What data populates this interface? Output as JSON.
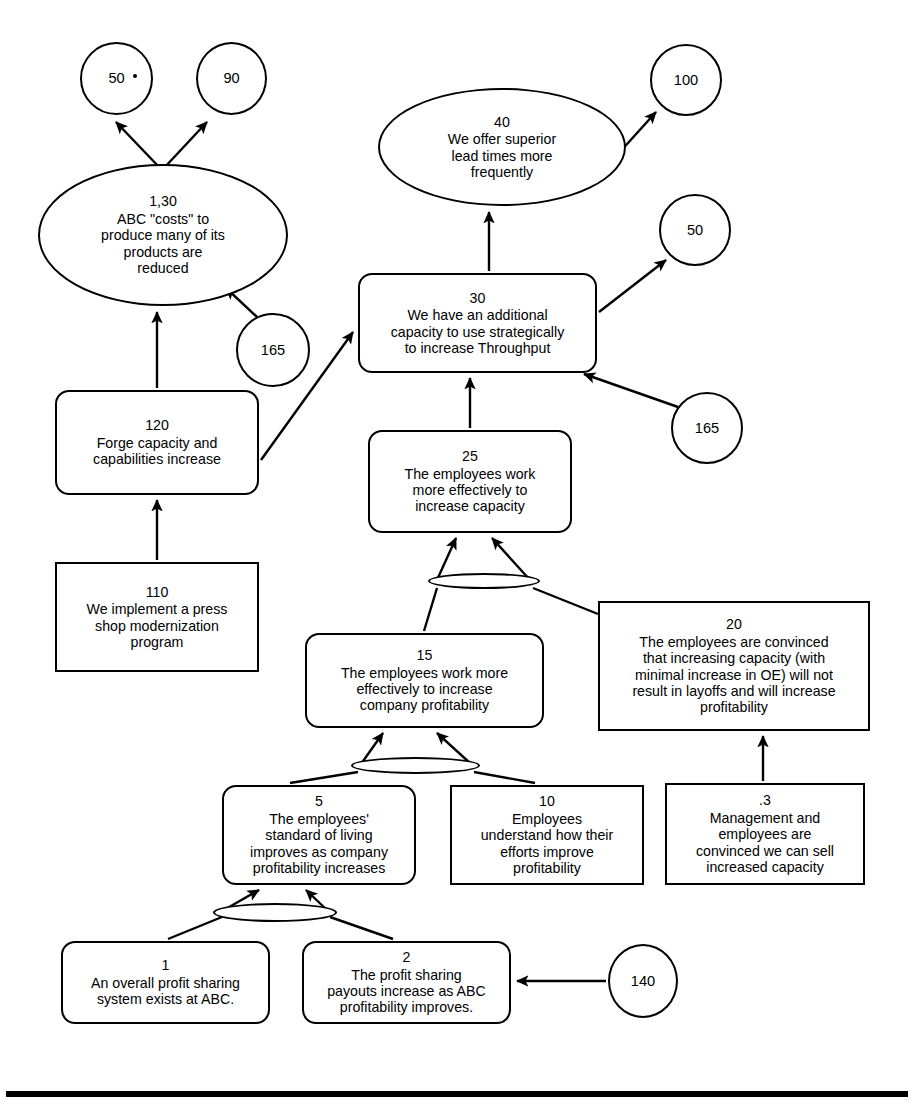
{
  "diagram": {
    "line_color": "#000000",
    "fill_color": "#ffffff",
    "nodes": [
      {
        "key": "n50a",
        "id": "50",
        "text": "",
        "shape": "circle",
        "x": 80,
        "y": 42,
        "w": 73,
        "h": 73
      },
      {
        "key": "n90",
        "id": "90",
        "text": "",
        "shape": "circle",
        "x": 196,
        "y": 42,
        "w": 71,
        "h": 73
      },
      {
        "key": "n130",
        "id": "1,30",
        "text": "ABC \"costs\" to\nproduce many of its\nproducts are\nreduced",
        "shape": "ellipse",
        "x": 38,
        "y": 164,
        "w": 250,
        "h": 142
      },
      {
        "key": "n120",
        "id": "120",
        "text": "Forge capacity and\ncapabilities increase",
        "shape": "roundbox",
        "x": 55,
        "y": 390,
        "w": 204,
        "h": 105
      },
      {
        "key": "n110",
        "id": "110",
        "text": "We implement a press\nshop modernization\nprogram",
        "shape": "box",
        "x": 55,
        "y": 562,
        "w": 204,
        "h": 110
      },
      {
        "key": "n165a",
        "id": "165",
        "text": "",
        "shape": "circle",
        "x": 236,
        "y": 313,
        "w": 74,
        "h": 74
      },
      {
        "key": "n40",
        "id": "40",
        "text": "We offer superior\nlead times more\nfrequently",
        "shape": "ellipse",
        "x": 378,
        "y": 88,
        "w": 248,
        "h": 118
      },
      {
        "key": "n100",
        "id": "100",
        "text": "",
        "shape": "circle",
        "x": 650,
        "y": 44,
        "w": 72,
        "h": 72
      },
      {
        "key": "n30",
        "id": "30",
        "text": "We have an additional\ncapacity to use strategically\nto increase Throughput",
        "shape": "roundbox",
        "x": 358,
        "y": 273,
        "w": 239,
        "h": 100
      },
      {
        "key": "n50b",
        "id": "50",
        "text": "",
        "shape": "circle",
        "x": 659,
        "y": 194,
        "w": 72,
        "h": 72
      },
      {
        "key": "n165b",
        "id": "165",
        "text": "",
        "shape": "circle",
        "x": 671,
        "y": 392,
        "w": 72,
        "h": 72
      },
      {
        "key": "n25",
        "id": "25",
        "text": "The employees work\nmore effectively to\nincrease capacity",
        "shape": "roundbox",
        "x": 368,
        "y": 430,
        "w": 204,
        "h": 103
      },
      {
        "key": "n20",
        "id": "20",
        "text": "The employees are convinced\nthat increasing capacity (with\nminimal increase in OE) will not\nresult in layoffs and will increase\nprofitability",
        "shape": "box",
        "x": 598,
        "y": 601,
        "w": 272,
        "h": 130
      },
      {
        "key": "n15",
        "id": "15",
        "text": "The employees work more\neffectively to increase\ncompany profitability",
        "shape": "roundbox",
        "x": 305,
        "y": 633,
        "w": 239,
        "h": 95
      },
      {
        "key": "n5",
        "id": "5",
        "text": "The employees'\nstandard of living\nimproves as company\nprofitability increases",
        "shape": "roundbox",
        "x": 222,
        "y": 785,
        "w": 194,
        "h": 100
      },
      {
        "key": "n10",
        "id": "10",
        "text": "Employees\nunderstand how their\nefforts improve\nprofitability",
        "shape": "box",
        "x": 450,
        "y": 785,
        "w": 194,
        "h": 100
      },
      {
        "key": "n3",
        "id": ".3",
        "text": "Management and\nemployees are\nconvinced we can sell\nincreased capacity",
        "shape": "box",
        "x": 665,
        "y": 783,
        "w": 200,
        "h": 102
      },
      {
        "key": "n1",
        "id": "1",
        "text": "An overall profit sharing\nsystem exists at ABC.",
        "shape": "roundbox",
        "x": 61,
        "y": 941,
        "w": 209,
        "h": 83
      },
      {
        "key": "n2",
        "id": "2",
        "text": "The profit sharing\npayouts increase as ABC\nprofitability improves.",
        "shape": "roundbox",
        "x": 302,
        "y": 941,
        "w": 209,
        "h": 83
      },
      {
        "key": "n140",
        "id": "140",
        "text": "",
        "shape": "circle",
        "x": 608,
        "y": 944,
        "w": 70,
        "h": 74
      }
    ],
    "and_connectors": [
      {
        "key": "and25",
        "x": 428,
        "y": 573,
        "w": 112,
        "h": 16
      },
      {
        "key": "and15",
        "x": 351,
        "y": 757,
        "w": 129,
        "h": 17
      },
      {
        "key": "and5",
        "x": 213,
        "y": 903,
        "w": 124,
        "h": 19
      }
    ],
    "edges": [
      {
        "key": "e130-50a",
        "from": "n130",
        "to": "n50a",
        "arrow": true
      },
      {
        "key": "e130-90",
        "from": "n130",
        "to": "n90",
        "arrow": true
      },
      {
        "key": "e120-130",
        "from": "n120",
        "to": "n130",
        "arrow": true
      },
      {
        "key": "e165a-130",
        "from": "n165a",
        "to": "n130",
        "arrow": true
      },
      {
        "key": "e110-120",
        "from": "n110",
        "to": "n120",
        "arrow": true
      },
      {
        "key": "e120-30",
        "from": "n120",
        "to": "n30",
        "arrow": true
      },
      {
        "key": "e30-40",
        "from": "n30",
        "to": "n40",
        "arrow": true
      },
      {
        "key": "e40-100",
        "from": "n40",
        "to": "n100",
        "arrow": true
      },
      {
        "key": "e30-50b",
        "from": "n30",
        "to": "n50b",
        "arrow": true
      },
      {
        "key": "e165b-30",
        "from": "n165b",
        "to": "n30",
        "arrow": true
      },
      {
        "key": "e25-30",
        "from": "n25",
        "to": "n30",
        "arrow": true
      },
      {
        "key": "e15-25",
        "from": "n15",
        "to": "n25",
        "arrow": true
      },
      {
        "key": "e20-25",
        "from": "n20",
        "to": "n25",
        "arrow": true
      },
      {
        "key": "e5-15",
        "from": "n5",
        "to": "n15",
        "arrow": true
      },
      {
        "key": "e10-15",
        "from": "n10",
        "to": "n15",
        "arrow": true
      },
      {
        "key": "e3-20",
        "from": "n3",
        "to": "n20",
        "arrow": true
      },
      {
        "key": "e1-5",
        "from": "n1",
        "to": "n5",
        "arrow": true
      },
      {
        "key": "e2-5",
        "from": "n2",
        "to": "n5",
        "arrow": true
      },
      {
        "key": "e140-2",
        "from": "n140",
        "to": "n2",
        "arrow": true
      }
    ],
    "baseline": {
      "x": 6,
      "y": 1091,
      "w": 902,
      "h": 6
    },
    "speck": {
      "x": 133,
      "y": 74,
      "w": 4,
      "h": 4
    }
  }
}
